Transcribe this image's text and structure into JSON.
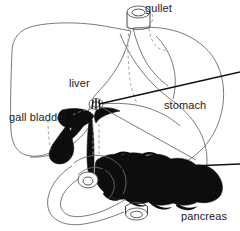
{
  "figure": {
    "background_color": "#ffffff",
    "outline_color": "#6b6b6b",
    "fill_color": "#0d0d0d",
    "label_color": "#1a1a1a",
    "width": 240,
    "height": 231
  },
  "labels": {
    "gullet": "gullet",
    "liver": "liver",
    "gall_bladder": "gall bladder",
    "stomach": "stomach",
    "pancreas": "pancreas"
  },
  "parts": [
    {
      "name": "gullet",
      "label": "gullet",
      "rendering": "open tube with elliptical lumen at top of figure",
      "filled": false
    },
    {
      "name": "liver",
      "label": "liver",
      "rendering": "large rounded outline occupying upper left",
      "filled": false
    },
    {
      "name": "gall-bladder",
      "label": "gall bladder",
      "rendering": "solid black pear shape below liver",
      "filled": true
    },
    {
      "name": "stomach",
      "label": "stomach",
      "rendering": "large curved outline occupying right side",
      "filled": false
    },
    {
      "name": "pancreas",
      "label": "pancreas",
      "rendering": "solid black lobulated leaf shape with central duct",
      "filled": true
    },
    {
      "name": "bile-ducts",
      "label": "",
      "rendering": "solid black branching ducts at centre with ring junction",
      "filled": true
    },
    {
      "name": "duodenum",
      "label": "",
      "rendering": "C-shaped loop outline below, ending in open tube",
      "filled": false
    }
  ]
}
